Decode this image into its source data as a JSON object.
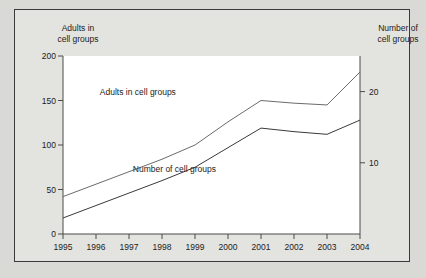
{
  "chart_data": {
    "type": "line",
    "title": "",
    "subtitle": "",
    "x": [
      1995,
      1996,
      1997,
      1998,
      1999,
      2000,
      2001,
      2002,
      2003,
      2004
    ],
    "xtick_labels": [
      "1995",
      "1996",
      "1997",
      "1998",
      "1999",
      "2000",
      "2001",
      "2002",
      "2003",
      "2004"
    ],
    "xlabel": "",
    "ylabel": "Adults in cell groups",
    "ylabel_right": "Number of cell groups",
    "ylim": [
      0,
      200
    ],
    "ytick_values": [
      0,
      50,
      100,
      150,
      200
    ],
    "ytick_labels": [
      "0",
      "50",
      "100",
      "150",
      "200"
    ],
    "ylim_right": [
      0,
      25
    ],
    "ytick_values_right": [
      10,
      20
    ],
    "ytick_labels_right": [
      "10",
      "20"
    ],
    "grid": false,
    "legend_position": "inline-annotations",
    "series": [
      {
        "name": "Adults in cell groups",
        "axis": "left",
        "color": "#6b6b6b",
        "values": [
          42,
          56,
          70,
          84,
          100,
          126,
          150,
          147,
          145,
          182
        ]
      },
      {
        "name": "Number of cell groups",
        "axis": "left_scaled",
        "color": "#3a3a3a",
        "values": [
          18,
          32,
          46,
          60,
          75,
          97,
          119,
          115,
          112,
          128
        ]
      }
    ],
    "annotations": [
      {
        "text": "Adults in cell groups",
        "x": 1998.6,
        "y": 158
      },
      {
        "text": "Number of cell groups",
        "x": 1999.6,
        "y": 72
      }
    ]
  },
  "axis_titles": {
    "left_line1": "Adults in",
    "left_line2": "cell groups",
    "right_line1": "Number of",
    "right_line2": "cell groups"
  },
  "colors": {
    "page_background": "#d9d9d6",
    "frame_background": "#e3e3e0",
    "plot_background": "#ffffff",
    "frame_border": "#3a3a3a",
    "axis": "#4a4a4a",
    "series_adults": "#6b6b6b",
    "series_groups": "#3a3a3a",
    "text": "#1c1c1c"
  }
}
